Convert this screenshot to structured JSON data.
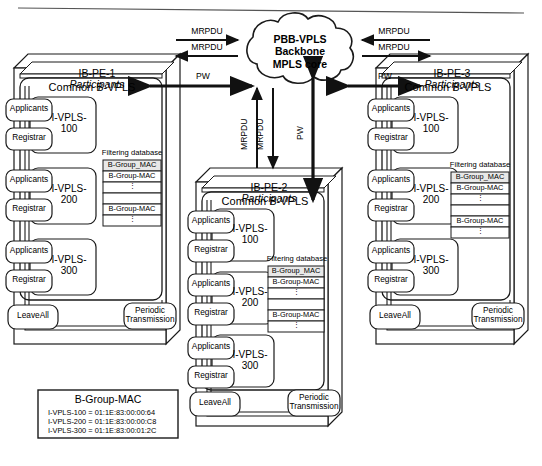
{
  "figure": {
    "kind": "network-architecture-diagram"
  },
  "cloud": {
    "name": "pbb-vpls-cloud",
    "line1": "PBB-VPLS",
    "line2": "Backbone",
    "line3": "MPLS core",
    "text": "PBB-VPLS\nBackbone\nMPLS core"
  },
  "arrow_labels": {
    "mrpdu": "MRPDU",
    "pw": "PW",
    "left_top": "MRPDU",
    "left_bottom": "MRPDU",
    "left_pw": "PW",
    "right_top": "MRPDU",
    "right_bottom": "MRPDU",
    "right_pw": "PW",
    "center_up": "MRPDU",
    "center_down": "MRPDU",
    "center_pw": "PW"
  },
  "common_labels": {
    "common_bvpls": "Common B-VPLS",
    "applicants": "Applicants",
    "registrar": "Registrar",
    "leave_all": "LeaveAll",
    "periodic_transmission": "Periodic\nTransmission",
    "filtering_database": "Filtering database",
    "participants": "Participants",
    "fdb_header": "B-Group_MAC",
    "fdb_entry": "B-Group-MAC",
    "fdb_ellipsis": "⋮"
  },
  "nodes": [
    {
      "id": "ib-pe-1",
      "name": "IB-PE-1",
      "suffix": "Participants",
      "common_bvpls": "Common B-VPLS",
      "instances": [
        {
          "label": "I-VPLS-\n100",
          "applicants": "Applicants",
          "registrar": "Registrar"
        },
        {
          "label": "I-VPLS-\n200",
          "applicants": "Applicants",
          "registrar": "Registrar"
        },
        {
          "label": "I-VPLS-\n300",
          "applicants": "Applicants",
          "registrar": "Registrar"
        }
      ],
      "filtering_database": {
        "caption": "Filtering database",
        "rows": [
          "B-Group_MAC",
          "B-Group-MAC",
          "⋮",
          "",
          "B-Group-MAC",
          "⋮"
        ]
      },
      "leave_all": "LeaveAll",
      "periodic_transmission": "Periodic\nTransmission"
    },
    {
      "id": "ib-pe-2",
      "name": "IB-PE-2",
      "suffix": "Participants",
      "common_bvpls": "Common B-VPLS",
      "instances": [
        {
          "label": "I-VPLS-\n100",
          "applicants": "Applicants",
          "registrar": "Registrar"
        },
        {
          "label": "I-VPLS-\n200",
          "applicants": "Applicants",
          "registrar": "Registrar"
        },
        {
          "label": "I-VPLS-\n300",
          "applicants": "Applicants",
          "registrar": "Registrar"
        }
      ],
      "filtering_database": {
        "caption": "Filtering database",
        "rows": [
          "B-Group_MAC",
          "B-Group-MAC",
          "⋮",
          "",
          "B-Group-MAC",
          "⋮"
        ]
      },
      "leave_all": "LeaveAll",
      "periodic_transmission": "Periodic\nTransmission"
    },
    {
      "id": "ib-pe-3",
      "name": "IB-PE-3",
      "suffix": "Participants",
      "common_bvpls": "Common B-VPLS",
      "instances": [
        {
          "label": "I-VPLS-\n100",
          "applicants": "Applicants",
          "registrar": "Registrar"
        },
        {
          "label": "I-VPLS-\n200",
          "applicants": "Applicants",
          "registrar": "Registrar"
        },
        {
          "label": "I-VPLS-\n300",
          "applicants": "Applicants",
          "registrar": "Registrar"
        }
      ],
      "filtering_database": {
        "caption": "Filtering database",
        "rows": [
          "B-Group_MAC",
          "B-Group-MAC",
          "⋮",
          "",
          "B-Group-MAC",
          "⋮"
        ]
      },
      "leave_all": "LeaveAll",
      "periodic_transmission": "Periodic\nTransmission"
    }
  ],
  "legend": {
    "title": "B-Group-MAC",
    "rows": [
      "I-VPLS-100 = 01:1E:83:00:00:64",
      "I-VPLS-200 = 01:1E:83:00:00:C8",
      "I-VPLS-300 = 01:1E:83:00:01:2C"
    ]
  },
  "colors": {
    "stroke": "#1a1a1a",
    "fill": "#ffffff",
    "background": "#ffffff",
    "fdb_header_fill": "#e8e8e8"
  }
}
